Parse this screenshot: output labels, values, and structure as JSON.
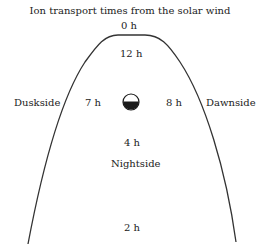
{
  "title": "Ion transport times from the solar wind",
  "labels": {
    "top": "0 h",
    "inner_top": "12 h",
    "duskside": "Duskside",
    "dawnside": "Dawnside",
    "left_time": "7 h",
    "right_time": "8 h",
    "below_earth": "4 h",
    "nightside": "Nightside",
    "tail": "2 h"
  },
  "colors": {
    "line": "#333333",
    "earth_fill": "#1a1a1a"
  }
}
